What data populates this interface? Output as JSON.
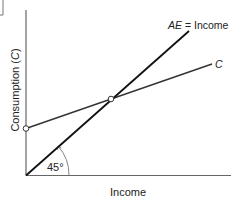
{
  "diagram": {
    "type": "keynesian-cross",
    "x_axis_label": "Income",
    "y_axis_label": "Consumption (C)",
    "y_axis_label_prefix": "Consumption (",
    "y_axis_label_var": "C",
    "y_axis_label_suffix": ")",
    "lines": [
      {
        "name": "ae-income-line",
        "label_var": "AE",
        "label_rest": " = Income",
        "slope_deg": 45,
        "color": "#111111"
      },
      {
        "name": "consumption-line",
        "label_var": "C",
        "color": "#333333"
      }
    ],
    "angle_label": "45°",
    "points": [
      {
        "name": "autonomous-consumption-point",
        "description": "y-intercept of C"
      },
      {
        "name": "equilibrium-point",
        "description": "intersection of C and AE = Income"
      }
    ],
    "colors": {
      "axis": "#555555",
      "ae_line": "#111111",
      "c_line": "#333333",
      "point_fill": "#ffffff",
      "text": "#222222"
    }
  }
}
